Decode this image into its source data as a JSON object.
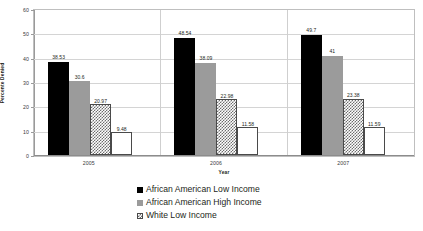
{
  "chart_data": {
    "type": "bar",
    "title": "",
    "xlabel": "Year",
    "ylabel": "Percente Denied",
    "categories": [
      "2005",
      "2006",
      "2007"
    ],
    "ylim": [
      0,
      60
    ],
    "yticks": [
      0,
      10,
      20,
      30,
      40,
      50,
      60
    ],
    "grid": true,
    "legend_position": "bottom",
    "series": [
      {
        "name": "African American Low Income",
        "swatch": "solid-black",
        "color": "#000000",
        "values": [
          38.53,
          48.54,
          49.7
        ],
        "labels": [
          "38.53",
          "48.54",
          "49.7"
        ]
      },
      {
        "name": "African American High Income",
        "swatch": "solid-gray",
        "color": "#9b9b9b",
        "values": [
          30.6,
          38.09,
          41
        ],
        "labels": [
          "30.6",
          "38.09",
          "41"
        ]
      },
      {
        "name": "White Low Income",
        "swatch": "checkered",
        "color": "#6e6e6e",
        "values": [
          20.97,
          22.98,
          23.38
        ],
        "labels": [
          "20.97",
          "22.98",
          "23.38"
        ]
      },
      {
        "name": "",
        "swatch": "white-outline",
        "color": "#ffffff",
        "values": [
          9.48,
          11.58,
          11.59
        ],
        "labels": [
          "9.48",
          "11.58",
          "11.59"
        ]
      }
    ]
  },
  "caption": {
    "text": ""
  }
}
